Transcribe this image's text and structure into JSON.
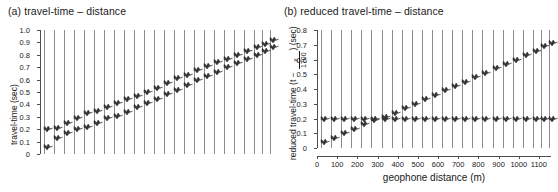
{
  "figure": {
    "background": "#ffffff",
    "trace_color": "#8c8c8c",
    "wiggle_color": "#333333",
    "axis_color": "#4d4d4d"
  },
  "panels": [
    {
      "id": "a",
      "title": "(a)  travel-time – distance",
      "ylabel": "travel-time (sec)",
      "ylabel_has_fraction": false,
      "xlabel": "",
      "show_xticks": false
    },
    {
      "id": "b",
      "title": "(b) reduced travel-time – distance",
      "ylabel_prefix": "reduced travel-time (t − ",
      "ylabel_frac_num": "x",
      "ylabel_frac_den": "1700",
      "ylabel_suffix": ") (sec)",
      "ylabel_has_fraction": true,
      "xlabel": "geophone distance (m)",
      "show_xticks": true
    }
  ],
  "chart_data": [
    {
      "type": "line",
      "panel": "a",
      "title": "(a)  travel-time – distance",
      "xlabel": "",
      "ylabel": "travel-time (sec)",
      "ylim": [
        0,
        1.0
      ],
      "yticks": [
        "0",
        "0.1",
        "0.2",
        "0.3",
        "0.4",
        "0.5",
        "0.6",
        "0.7",
        "0.8",
        "0.9",
        "1.0"
      ],
      "ytick_values": [
        0,
        0.1,
        0.2,
        0.3,
        0.4,
        0.5,
        0.6,
        0.7,
        0.8,
        0.9,
        1.0
      ],
      "xlim": [
        0,
        1160
      ],
      "xticks": [],
      "xtick_labels": [],
      "grid": false,
      "legend": "none",
      "n_traces": 24,
      "trace_x": [
        20,
        70,
        120,
        170,
        220,
        270,
        320,
        370,
        420,
        470,
        520,
        570,
        620,
        670,
        720,
        770,
        820,
        870,
        920,
        970,
        1020,
        1070,
        1110,
        1150
      ],
      "series": [
        {
          "name": "first-arrival travel-time",
          "values": [
            0.06,
            0.13,
            0.17,
            0.2,
            0.22,
            0.25,
            0.29,
            0.31,
            0.34,
            0.38,
            0.41,
            0.44,
            0.48,
            0.52,
            0.56,
            0.6,
            0.63,
            0.66,
            0.7,
            0.73,
            0.77,
            0.8,
            0.83,
            0.86
          ]
        },
        {
          "name": "secondary branch",
          "values": [
            0.2,
            0.21,
            0.25,
            0.29,
            0.33,
            0.35,
            0.38,
            0.41,
            0.44,
            0.47,
            0.5,
            0.53,
            0.57,
            0.61,
            0.64,
            0.68,
            0.71,
            0.74,
            0.77,
            0.8,
            0.83,
            0.86,
            0.89,
            0.92
          ]
        }
      ]
    },
    {
      "type": "line",
      "panel": "b",
      "title": "(b) reduced travel-time – distance",
      "xlabel": "geophone distance (m)",
      "ylabel": "reduced travel-time (t − x/1700) (sec)",
      "ylim": [
        0,
        0.8
      ],
      "yticks": [
        "0",
        "0.1",
        "0.2",
        "0.3",
        "0.4",
        "0.5",
        "0.6",
        "0.7",
        "0.8"
      ],
      "ytick_values": [
        0,
        0.1,
        0.2,
        0.3,
        0.4,
        0.5,
        0.6,
        0.7,
        0.8
      ],
      "xlim": [
        0,
        1160
      ],
      "xticks": [
        0,
        100,
        200,
        300,
        400,
        500,
        600,
        700,
        800,
        900,
        1000,
        1100
      ],
      "xtick_labels": [
        "0",
        "100",
        "200",
        "300",
        "400",
        "500",
        "600",
        "700",
        "800",
        "900",
        "1000",
        "1100"
      ],
      "grid": false,
      "legend": "none",
      "n_traces": 24,
      "trace_x": [
        20,
        70,
        120,
        170,
        220,
        270,
        320,
        370,
        420,
        470,
        520,
        570,
        620,
        670,
        720,
        770,
        820,
        870,
        920,
        970,
        1020,
        1070,
        1110,
        1150
      ],
      "series": [
        {
          "name": "direct-wave branch",
          "values": [
            0.04,
            0.07,
            0.1,
            0.13,
            0.16,
            0.19,
            0.21,
            0.24,
            0.27,
            0.3,
            0.33,
            0.36,
            0.39,
            0.42,
            0.45,
            0.48,
            0.51,
            0.54,
            0.57,
            0.6,
            0.63,
            0.66,
            0.69,
            0.71
          ]
        },
        {
          "name": "refracted flat branch",
          "values": [
            0.2,
            0.2,
            0.2,
            0.2,
            0.2,
            0.2,
            0.2,
            0.2,
            0.2,
            0.2,
            0.2,
            0.2,
            0.2,
            0.2,
            0.2,
            0.2,
            0.2,
            0.2,
            0.2,
            0.2,
            0.2,
            0.2,
            0.2,
            0.2
          ]
        }
      ]
    }
  ]
}
